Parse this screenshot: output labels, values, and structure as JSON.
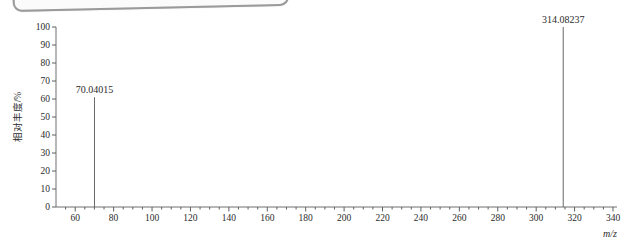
{
  "colors": {
    "axis_line": "#6f6f6f",
    "tick": "#5f5f5f",
    "text": "#2b2b2b",
    "peak_line": "#6a6a6a",
    "frame_border": "#9a9a9a"
  },
  "chart_data": {
    "type": "bar",
    "subtype": "mass-spectrum-stick",
    "title": "",
    "xlabel": "m/z",
    "ylabel": "相对丰度/%",
    "xlim": [
      50,
      340
    ],
    "ylim": [
      0,
      100
    ],
    "grid": false,
    "legend": false,
    "x_major_tick_start": 60,
    "x_major_tick_step": 20,
    "x_minor_tick_step": 5,
    "y_tick_step": 10,
    "x_tick_labels": [
      "60",
      "80",
      "100",
      "120",
      "140",
      "160",
      "180",
      "200",
      "220",
      "240",
      "260",
      "280",
      "300",
      "320",
      "340"
    ],
    "y_tick_labels": [
      "0",
      "10",
      "20",
      "30",
      "40",
      "50",
      "60",
      "70",
      "80",
      "90",
      "100"
    ],
    "peaks": [
      {
        "mz": 70.04015,
        "rel_abundance": 61,
        "label": "70.04015"
      },
      {
        "mz": 314.08237,
        "rel_abundance": 100,
        "label": "314.08237"
      }
    ]
  }
}
